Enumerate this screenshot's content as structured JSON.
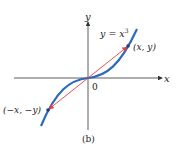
{
  "figure": {
    "caption": "(b)",
    "curve_label": "y = x",
    "curve_label_exp": "3",
    "axis_x_label": "x",
    "axis_y_label": "y",
    "origin_label": "0",
    "point_pos_label": "(x, y)",
    "point_neg_label": "(−x, −y)",
    "colors": {
      "curve": "#2a6bbf",
      "vector": "#e04040",
      "axes": "#333333",
      "points": "#1f3f8f"
    }
  }
}
